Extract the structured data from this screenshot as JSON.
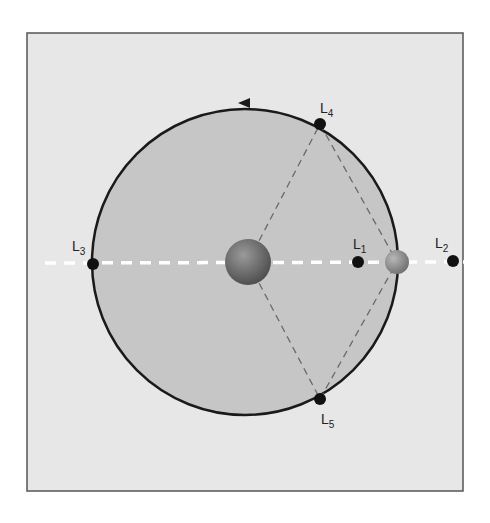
{
  "diagram": {
    "type": "lagrange-points",
    "colors": {
      "page_bg": "#ffffff",
      "panel_bg": "#e7e7e7",
      "panel_border": "#555555",
      "orbit_fill": "#c6c6c6",
      "orbit_stroke": "#1a1a1a",
      "axis_line": "#ffffff",
      "triangle_lines": "#6a6a6a",
      "point_fill": "#111111"
    },
    "primary_body": {
      "name": "primary-body",
      "cx": 248,
      "cy": 262,
      "r": 23
    },
    "secondary_body": {
      "name": "secondary-body",
      "cx": 397,
      "cy": 262,
      "r": 12
    },
    "orbit": {
      "cx": 245,
      "cy": 262,
      "r": 153,
      "direction": "counter-clockwise"
    },
    "points": [
      {
        "id": "L1",
        "main": "L",
        "sub": "1",
        "cx": 358,
        "cy": 262,
        "label_x": 353,
        "label_y": 249
      },
      {
        "id": "L2",
        "main": "L",
        "sub": "2",
        "cx": 453,
        "cy": 261,
        "label_x": 435,
        "label_y": 248
      },
      {
        "id": "L3",
        "main": "L",
        "sub": "3",
        "cx": 93,
        "cy": 264,
        "label_x": 72,
        "label_y": 251
      },
      {
        "id": "L4",
        "main": "L",
        "sub": "4",
        "cx": 320,
        "cy": 124,
        "label_x": 320,
        "label_y": 113
      },
      {
        "id": "L5",
        "main": "L",
        "sub": "5",
        "cx": 320,
        "cy": 399,
        "label_x": 321,
        "label_y": 424
      }
    ]
  }
}
